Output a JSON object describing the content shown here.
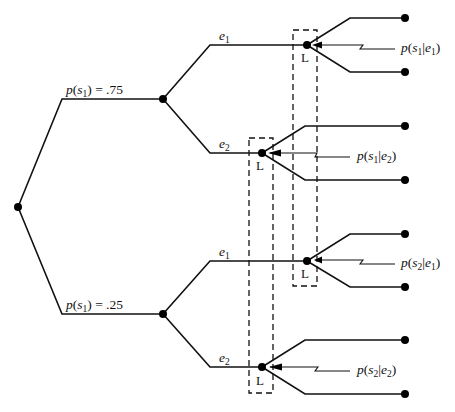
{
  "diagram": {
    "type": "decision-tree",
    "root": {
      "label": ""
    },
    "branches": [
      {
        "id": "upper",
        "prob_label": {
          "p": "p",
          "s": "s",
          "sub": "1",
          "rest": ") = .75"
        },
        "prob_text": "p(s1) = .75",
        "experiments": [
          {
            "label_e": "e",
            "label_sub": "1",
            "info_set": "L",
            "annot": {
              "p": "p",
              "s": "s",
              "s_sub": "1",
              "e": "e",
              "e_sub": "1"
            },
            "annot_text": "p(s1|e1)"
          },
          {
            "label_e": "e",
            "label_sub": "2",
            "info_set": "L",
            "annot": {
              "p": "p",
              "s": "s",
              "s_sub": "1",
              "e": "e",
              "e_sub": "2"
            },
            "annot_text": "p(s1|e2)"
          }
        ]
      },
      {
        "id": "lower",
        "prob_label": {
          "p": "p",
          "s": "s",
          "sub": "1",
          "rest": ") = .25"
        },
        "prob_text": "p(s1) = .25",
        "experiments": [
          {
            "label_e": "e",
            "label_sub": "1",
            "info_set": "L",
            "annot": {
              "p": "p",
              "s": "s",
              "s_sub": "2",
              "e": "e",
              "e_sub": "1"
            },
            "annot_text": "p(s2|e1)"
          },
          {
            "label_e": "e",
            "label_sub": "2",
            "info_set": "L",
            "annot": {
              "p": "p",
              "s": "s",
              "s_sub": "2",
              "e": "e",
              "e_sub": "2"
            },
            "annot_text": "p(s2|e2)"
          }
        ]
      }
    ],
    "info_set_boxes": [
      {
        "name": "e1-information-set",
        "label": "L"
      },
      {
        "name": "e2-information-set",
        "label": "L"
      }
    ]
  }
}
